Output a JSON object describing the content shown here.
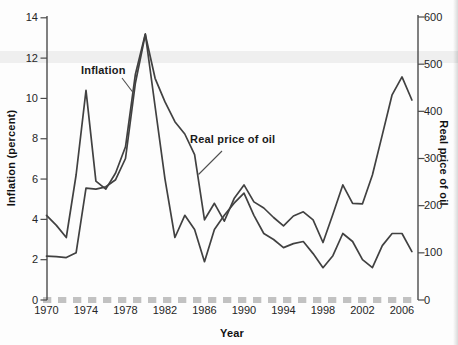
{
  "figure": {
    "background": "#fdfdfd",
    "line_color": "#414141",
    "axis_color": "#4a4a4a",
    "dash_color": "#c2c2c2",
    "pointer_color": "#4f4f4f"
  },
  "chart_data": {
    "type": "line",
    "title": "",
    "xlabel": "Year",
    "ylabel_left": "Inflation (percent)",
    "ylabel_right": "Real price of oil",
    "grid": false,
    "legend": "inline-annotations",
    "ylim_left": [
      0,
      14
    ],
    "ylim_right": [
      0,
      600
    ],
    "yticks_left": [
      0,
      2,
      4,
      6,
      8,
      10,
      12,
      14
    ],
    "yticks_right": [
      0,
      100,
      200,
      300,
      400,
      500,
      600
    ],
    "xticks": [
      1970,
      1974,
      1978,
      1982,
      1986,
      1990,
      1994,
      1998,
      2002,
      2006
    ],
    "x": [
      1970,
      1971,
      1972,
      1973,
      1974,
      1975,
      1976,
      1977,
      1978,
      1979,
      1980,
      1981,
      1982,
      1983,
      1984,
      1985,
      1986,
      1987,
      1988,
      1989,
      1990,
      1991,
      1992,
      1993,
      1994,
      1995,
      1996,
      1997,
      1998,
      1999,
      2000,
      2001,
      2002,
      2003,
      2004,
      2005,
      2006,
      2007
    ],
    "series": [
      {
        "name": "Inflation",
        "axis": "left",
        "values": [
          4.2,
          3.7,
          3.1,
          6.2,
          10.4,
          5.9,
          5.5,
          6.3,
          7.6,
          11.2,
          13.2,
          9.6,
          6.0,
          3.1,
          4.2,
          3.5,
          1.9,
          3.5,
          4.2,
          4.8,
          5.3,
          4.2,
          3.3,
          3.0,
          2.6,
          2.8,
          2.9,
          2.3,
          1.6,
          2.2,
          3.3,
          2.9,
          2.0,
          1.6,
          2.7,
          3.3,
          3.3,
          2.4
        ]
      },
      {
        "name": "Real price of oil",
        "axis": "right",
        "values": [
          93,
          92,
          90,
          100,
          237,
          235,
          240,
          255,
          300,
          460,
          563,
          470,
          420,
          378,
          352,
          308,
          170,
          205,
          167,
          215,
          244,
          208,
          195,
          175,
          157,
          178,
          187,
          170,
          122,
          182,
          244,
          205,
          204,
          265,
          350,
          435,
          473,
          424
        ]
      }
    ],
    "annotations": [
      {
        "text": "Inflation",
        "series": "Inflation"
      },
      {
        "text": "Real price of oil",
        "series": "Real price of oil"
      }
    ]
  }
}
